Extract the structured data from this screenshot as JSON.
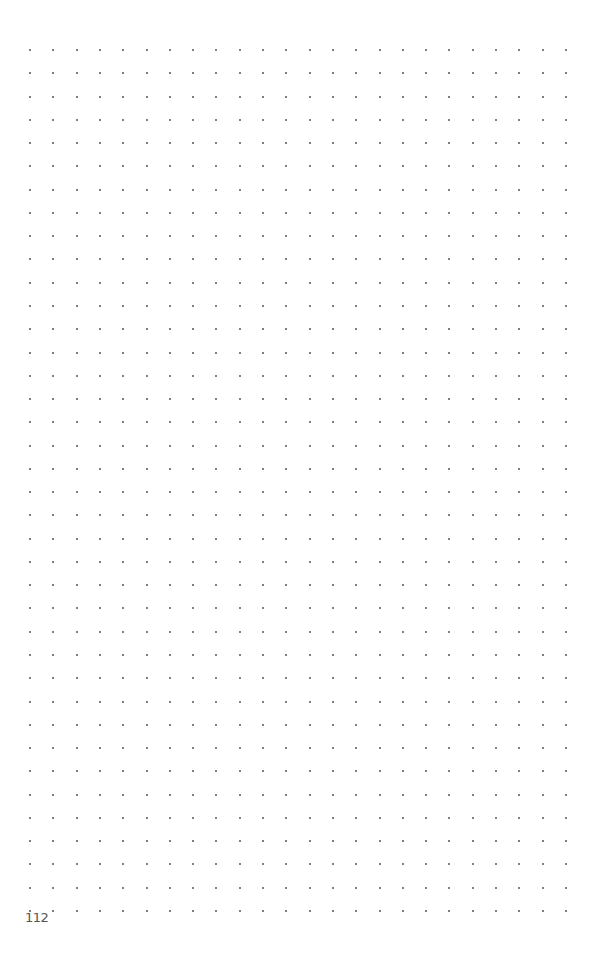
{
  "page": {
    "type": "dot-grid notebook page",
    "page_number": "112",
    "background_color": "#ffffff",
    "dot_color": "#555555"
  },
  "grid": {
    "columns": 24,
    "rows": 38,
    "origin_x": 30,
    "origin_y": 50,
    "spacing_x": 23.3,
    "spacing_y": 23.27
  }
}
